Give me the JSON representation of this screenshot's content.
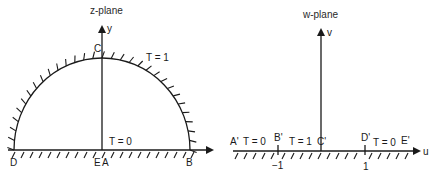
{
  "z_plane": {
    "title": "z-plane",
    "axis_y_label": "y",
    "points": {
      "C": "C",
      "D": "D",
      "E": "E",
      "A": "A",
      "B": "B"
    },
    "boundary_labels": {
      "arc": "T = 1",
      "base": "T = 0"
    }
  },
  "w_plane": {
    "title": "w-plane",
    "axis_v_label": "v",
    "axis_u_label": "u",
    "points": {
      "A": "A'",
      "B": "B'",
      "C": "C'",
      "D": "D'",
      "E": "E'"
    },
    "segment_labels": {
      "left": "T = 0",
      "middle": "T = 1",
      "right": "T = 0"
    },
    "ticks": {
      "neg": "−1",
      "pos": "1"
    }
  },
  "colors": {
    "ink": "#1a1a1a",
    "background": "#ffffff"
  }
}
